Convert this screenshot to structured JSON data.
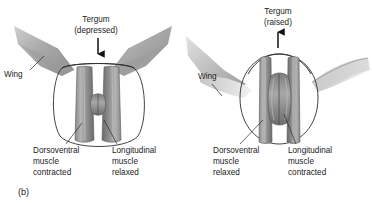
{
  "figure": {
    "panel_tag": "(b)",
    "background_color": "#ffffff",
    "outline_color": "#2f2f2f",
    "text_color": "#1b1b1b",
    "muscle_dark": "#6f6f6f",
    "muscle_mid": "#8e8e8e",
    "muscle_light": "#b9b9b9",
    "thorax_fill_light": "#f2f2f2",
    "wing_fill": "#b0b0b0"
  },
  "panels": [
    {
      "id": "left-panel",
      "state": "downstroke",
      "tergum_label_line1": "Tergum",
      "tergum_label_line2": "(depressed)",
      "tergum_arrow_direction": "down",
      "wing_label": "Wing",
      "wing_position": "raised",
      "dorsoventral_label_line1": "Dorsoventral",
      "dorsoventral_label_line2": "muscle",
      "dorsoventral_label_line3": "contracted",
      "longitudinal_label_line1": "Longitudinal",
      "longitudinal_label_line2": "muscle",
      "longitudinal_label_line3": "relaxed",
      "thorax_shape": "wide-flattened"
    },
    {
      "id": "right-panel",
      "state": "upstroke",
      "tergum_label_line1": "Tergum",
      "tergum_label_line2": "(raised)",
      "tergum_arrow_direction": "up",
      "wing_label": "Wing",
      "wing_position": "lowered",
      "dorsoventral_label_line1": "Dorsoventral",
      "dorsoventral_label_line2": "muscle",
      "dorsoventral_label_line3": "relaxed",
      "longitudinal_label_line1": "Longitudinal",
      "longitudinal_label_line2": "muscle",
      "longitudinal_label_line3": "contracted",
      "thorax_shape": "tall-rounded"
    }
  ]
}
